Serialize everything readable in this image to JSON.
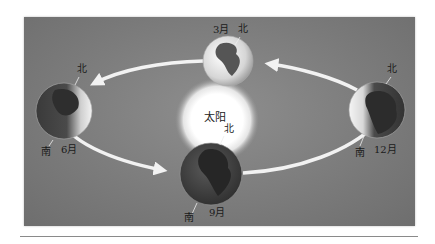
{
  "figure": {
    "sun_label": "太阳",
    "colors": {
      "background": "#7e7e7e",
      "sun": "#ffffff",
      "orbit_arrow": "#f2f2f2",
      "earth_lit": "#e6e6e6",
      "earth_dark": "#3e3e3e"
    },
    "earths": [
      {
        "position": "top",
        "month": "3月",
        "north": "北",
        "south": ""
      },
      {
        "position": "left",
        "month": "6月",
        "north": "北",
        "south": "南"
      },
      {
        "position": "bottom",
        "month": "9月",
        "north": "北",
        "south": "南"
      },
      {
        "position": "right",
        "month": "12月",
        "north": "北",
        "south": "南"
      }
    ],
    "orbit_direction": "counterclockwise (3月 → 6月 → 9月 → 12月 → 3月)"
  }
}
